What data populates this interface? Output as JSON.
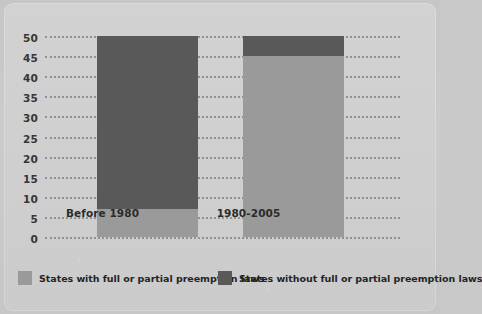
{
  "chart_data": {
    "type": "bar",
    "subtype": "stacked-bar",
    "title": "",
    "xlabel": "",
    "ylabel": "",
    "categories": [
      "Before 1980",
      "1980-2005"
    ],
    "series": [
      {
        "name": "States with full or partial preemption laws",
        "color": "#9a9a9a",
        "values": [
          7,
          45
        ]
      },
      {
        "name": "States without full or partial preemption laws",
        "color": "#595959",
        "values": [
          43,
          5
        ]
      }
    ],
    "ylim": [
      0,
      50
    ],
    "ytick_step": 5,
    "yticks": [
      "50",
      "45",
      "40",
      "35",
      "30",
      "25",
      "20",
      "15",
      "10",
      "5",
      "0"
    ],
    "grid": true,
    "grid_style": "dotted-horizontal",
    "legend_position": "bottom",
    "stack_total": 50
  },
  "legend": {
    "items": [
      {
        "label": "States with full or partial preemption laws",
        "color": "#9a9a9a"
      },
      {
        "label": "States without full or partial preemption laws",
        "color": "#595959"
      }
    ]
  },
  "colors": {
    "light_gray": "#9a9a9a",
    "dark_gray": "#595959",
    "background": "#cdcdcd",
    "grid": "#8e8e8e",
    "text": "#2b2b2b"
  }
}
